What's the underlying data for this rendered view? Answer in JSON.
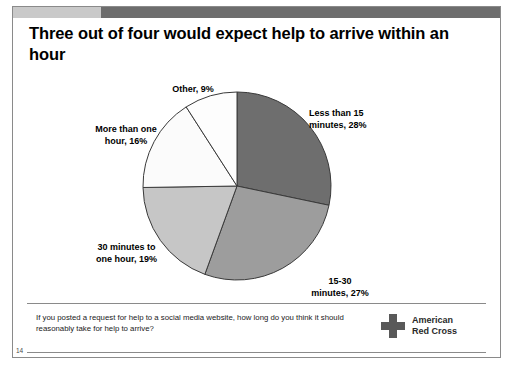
{
  "slide": {
    "title": "Three out of four would expect help to arrive within an hour",
    "number": "14",
    "topbar": {
      "left_color": "#c9c9c9",
      "right_color": "#6d6d6d"
    }
  },
  "labels": {
    "other": "Other, 9%",
    "less_than_15": "Less than 15\nminutes, 28%",
    "more_than_one_hour": "More than one\nhour, 16%",
    "thirty_to_one_hour": "30 minutes to\none hour, 19%",
    "fifteen_to_thirty": "15-30\nminutes, 27%"
  },
  "footer": {
    "question": "If you posted a request for help to a social media website, how long do you think it should reasonably take for help to arrive?",
    "logo_text": "American\nRed Cross",
    "logo_color": "#595959"
  },
  "chart_data": {
    "type": "pie",
    "title": "Three out of four would expect help to arrive within an hour",
    "subtitle": "",
    "xlabel": "",
    "ylabel": "",
    "legend_position": "none",
    "grid": false,
    "start_angle_deg": 0,
    "direction": "clockwise",
    "center": {
      "x": 236,
      "y": 185
    },
    "radius": 94,
    "categories": [
      "Less than 15 minutes",
      "15-30 minutes",
      "30 minutes to one hour",
      "More than one hour",
      "Other"
    ],
    "values": [
      28,
      27,
      19,
      16,
      9
    ],
    "labels": [
      "Less than 15 minutes, 28%",
      "15-30 minutes, 27%",
      "30 minutes to one hour, 19%",
      "More than one hour, 16%",
      "Other, 9%"
    ],
    "colors": [
      "#6e6e6e",
      "#9d9d9d",
      "#c6c6c6",
      "#fbfbfb",
      "#fdfdfd"
    ],
    "stroke": "#3a3a3a",
    "units": "percent",
    "annotation": "If you posted a request for help to a social media website, how long do you think it should reasonably take for help to arrive?"
  }
}
